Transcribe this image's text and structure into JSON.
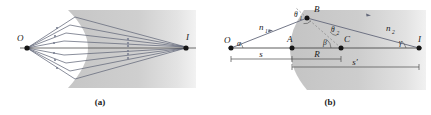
{
  "figure": {
    "kind": "optics-refraction-spherical-surface",
    "panels": [
      {
        "id": "a",
        "caption": "(a)",
        "points": [
          {
            "name": "object-point",
            "label": "O"
          },
          {
            "name": "image-point",
            "label": "I"
          }
        ]
      },
      {
        "id": "b",
        "caption": "(b)",
        "points": [
          {
            "name": "object-point",
            "label": "O"
          },
          {
            "name": "vertex-point",
            "label": "A"
          },
          {
            "name": "incidence-point",
            "label": "B"
          },
          {
            "name": "center-of-curvature",
            "label": "C"
          },
          {
            "name": "image-point",
            "label": "I"
          }
        ],
        "media": [
          {
            "name": "index-left",
            "label": "n",
            "subscript": "1"
          },
          {
            "name": "index-right",
            "label": "n",
            "subscript": "2"
          }
        ],
        "angles": [
          {
            "name": "angle-of-incidence",
            "label": "θ",
            "subscript": "1"
          },
          {
            "name": "angle-of-refraction",
            "label": "θ",
            "subscript": "2"
          },
          {
            "name": "angle-alpha",
            "label": "α",
            "subscript": ""
          },
          {
            "name": "angle-beta",
            "label": "β",
            "subscript": ""
          },
          {
            "name": "angle-gamma",
            "label": "γ",
            "subscript": ""
          }
        ],
        "dimensions": [
          {
            "name": "object-distance",
            "label": "s"
          },
          {
            "name": "radius-of-curvature",
            "label": "R"
          },
          {
            "name": "image-distance",
            "label": "s′"
          }
        ]
      }
    ],
    "colors": {
      "medium_fill": "#c9c9c9",
      "medium_fill_light": "#dedede",
      "ray": "#5a5f6e",
      "axis": "#4a4a4a",
      "dashed": "#8a8a8a",
      "text": "#1a1a1a",
      "background": "#ffffff"
    }
  }
}
